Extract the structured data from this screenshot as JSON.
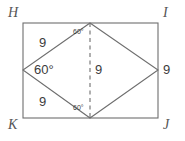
{
  "figure": {
    "type": "geometry-diagram",
    "canvas": {
      "width": 185,
      "height": 141
    },
    "colors": {
      "background": "#ffffff",
      "stroke": "#6e6e6e",
      "text": "#3c3c3c",
      "vertex_text": "#555555"
    },
    "rectangle": {
      "name": "HIJK",
      "vertices": [
        {
          "label": "H",
          "x": 23,
          "y": 23,
          "label_x": 8,
          "label_y": 6
        },
        {
          "label": "I",
          "x": 158,
          "y": 23,
          "label_x": 163,
          "label_y": 6
        },
        {
          "label": "J",
          "x": 158,
          "y": 118,
          "label_x": 163,
          "label_y": 118
        },
        {
          "label": "K",
          "x": 23,
          "y": 118,
          "label_x": 8,
          "label_y": 118
        }
      ]
    },
    "rhombus": {
      "vertices": [
        {
          "x": 90,
          "y": 23
        },
        {
          "x": 158,
          "y": 70
        },
        {
          "x": 90,
          "y": 118
        },
        {
          "x": 23,
          "y": 70
        }
      ]
    },
    "dashed_segment": {
      "x1": 90,
      "y1": 23,
      "x2": 90,
      "y2": 118
    },
    "side_labels": [
      {
        "id": "side-top-left",
        "text": "9",
        "x": 39,
        "y": 36
      },
      {
        "id": "side-bottom-left",
        "text": "9",
        "x": 39,
        "y": 95
      },
      {
        "id": "side-middle",
        "text": "9",
        "x": 95,
        "y": 63
      },
      {
        "id": "side-right",
        "text": "9",
        "x": 163,
        "y": 63
      }
    ],
    "angle_labels": [
      {
        "id": "angle-left",
        "text": "60°",
        "size": "large",
        "x": 34,
        "y": 63
      },
      {
        "id": "angle-top",
        "text": "60°",
        "size": "small",
        "x": 73,
        "y": 28
      },
      {
        "id": "angle-bottom",
        "text": "60°",
        "size": "small",
        "x": 73,
        "y": 104
      }
    ]
  }
}
